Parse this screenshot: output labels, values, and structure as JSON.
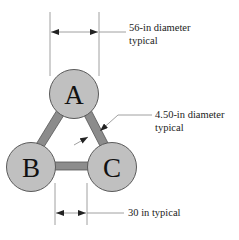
{
  "diagram": {
    "nodes": [
      {
        "id": "A",
        "label": "A",
        "cx": 74,
        "cy": 94,
        "r": 24.5
      },
      {
        "id": "B",
        "label": "B",
        "cx": 31,
        "cy": 167,
        "r": 24.5
      },
      {
        "id": "C",
        "label": "C",
        "cx": 112,
        "cy": 167,
        "r": 24.5
      }
    ],
    "edges": [
      {
        "from": "A",
        "to": "B"
      },
      {
        "from": "A",
        "to": "C"
      },
      {
        "from": "B",
        "to": "C"
      }
    ],
    "annotations": {
      "top_dimension": {
        "line1": "56-in diameter",
        "line2": "typical"
      },
      "strut_dimension": {
        "line1": "4.50-in diameter",
        "line2": "typical"
      },
      "bottom_dimension": {
        "line1": "30 in typical"
      }
    },
    "colors": {
      "node_fill": "#c0c0c0",
      "node_stroke": "#5a5a5a",
      "strut_fill": "#8c8c8c",
      "strut_stroke": "#555555",
      "dimension_line": "#888888",
      "text": "#222222"
    }
  }
}
